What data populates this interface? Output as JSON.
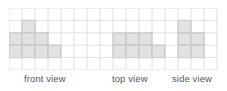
{
  "figure": {
    "name": "orthographic-views-grid",
    "background_color": "#ffffff",
    "grid": {
      "columns": 16,
      "rows": 5,
      "cell_width": 13,
      "cell_height": 12.4,
      "origin_x": 9,
      "origin_y": 8,
      "line_color": "#d8d8d8",
      "line_width": 0.8,
      "shaded_fill": "#e2e2e2",
      "shaded_stroke": "#b8b8b8",
      "shaded_stroke_width": 1.1
    },
    "shaded_cells": {
      "front_view": [
        {
          "col": 1,
          "row": 1
        },
        {
          "col": 0,
          "row": 2
        },
        {
          "col": 1,
          "row": 2
        },
        {
          "col": 2,
          "row": 2
        },
        {
          "col": 0,
          "row": 3
        },
        {
          "col": 1,
          "row": 3
        },
        {
          "col": 2,
          "row": 3
        },
        {
          "col": 3,
          "row": 3
        }
      ],
      "top_view": [
        {
          "col": 8,
          "row": 2
        },
        {
          "col": 9,
          "row": 2
        },
        {
          "col": 10,
          "row": 2
        },
        {
          "col": 8,
          "row": 3
        },
        {
          "col": 9,
          "row": 3
        },
        {
          "col": 10,
          "row": 3
        },
        {
          "col": 11,
          "row": 3
        }
      ],
      "side_view": [
        {
          "col": 13,
          "row": 1
        },
        {
          "col": 13,
          "row": 2
        },
        {
          "col": 14,
          "row": 2
        },
        {
          "col": 13,
          "row": 3
        },
        {
          "col": 14,
          "row": 3
        }
      ]
    },
    "labels": {
      "front": "front view",
      "top": "top view",
      "side": "side view",
      "text_color": "#58585a"
    }
  },
  "chart_data": {
    "type": "heatmap",
    "title": "",
    "xlabel": "",
    "ylabel": "",
    "grid_columns": 16,
    "grid_rows": 5,
    "legend": [
      "front view",
      "top view",
      "side view"
    ],
    "legend_position": "below",
    "grid": true,
    "categories": [
      "front view",
      "top view",
      "side view"
    ],
    "values": [
      8,
      7,
      5
    ],
    "series": [
      {
        "name": "front view",
        "cells": [
          [
            1,
            1
          ],
          [
            0,
            2
          ],
          [
            1,
            2
          ],
          [
            2,
            2
          ],
          [
            0,
            3
          ],
          [
            1,
            3
          ],
          [
            2,
            3
          ],
          [
            3,
            3
          ]
        ],
        "shape_rows": [
          [
            0,
            1,
            0,
            0
          ],
          [
            1,
            1,
            1,
            0
          ],
          [
            1,
            1,
            1,
            1
          ]
        ]
      },
      {
        "name": "top view",
        "cells": [
          [
            8,
            2
          ],
          [
            9,
            2
          ],
          [
            10,
            2
          ],
          [
            8,
            3
          ],
          [
            9,
            3
          ],
          [
            10,
            3
          ],
          [
            11,
            3
          ]
        ],
        "shape_rows": [
          [
            1,
            1,
            1,
            0
          ],
          [
            1,
            1,
            1,
            1
          ]
        ]
      },
      {
        "name": "side view",
        "cells": [
          [
            13,
            1
          ],
          [
            13,
            2
          ],
          [
            14,
            2
          ],
          [
            13,
            3
          ],
          [
            14,
            3
          ]
        ],
        "shape_rows": [
          [
            1,
            0
          ],
          [
            1,
            1
          ],
          [
            1,
            1
          ]
        ]
      }
    ]
  }
}
